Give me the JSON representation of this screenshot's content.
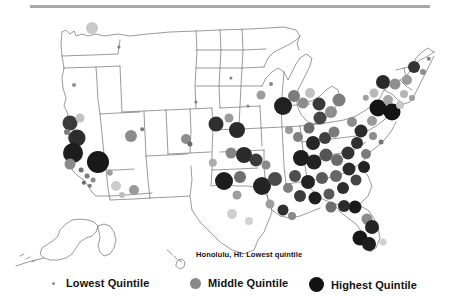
{
  "figure": {
    "type": "map",
    "region": "United States",
    "projection_insets": [
      "Alaska",
      "Hawaii"
    ],
    "annotation": {
      "text": "Honolulu, HI: Lowest quintile",
      "x": 196,
      "y": 250
    }
  },
  "legend": {
    "items": [
      {
        "label": "Lowest Quintile",
        "marker": "small-dot",
        "color": "#8c8c8c",
        "size": 3,
        "x": 48
      },
      {
        "label": "Middle Quintile",
        "marker": "medium-dot",
        "color": "#8a8a8a",
        "size": 11,
        "x": 190
      },
      {
        "label": "Highest Quintile",
        "marker": "large-dot",
        "color": "#121212",
        "size": 15,
        "x": 309
      }
    ]
  },
  "colors": {
    "lowest": "#9b9b9b",
    "lower_mid": "#c4c4c4",
    "middle": "#7e7e7e",
    "upper_mid": "#4a4a4a",
    "highest": "#141414",
    "outline": "#6f6f6f",
    "rule": "#a8a8a8"
  },
  "chart_data": {
    "type": "scatter",
    "title": "",
    "xlabel": "",
    "ylabel": "",
    "encoding": "Marker size and darkness encode quintile rank of metropolitan areas",
    "markers": [
      {
        "x": 92,
        "y": 18,
        "r": 6,
        "c": "#c9c9c9"
      },
      {
        "x": 119,
        "y": 37,
        "r": 1.6,
        "c": "#7a7a7a"
      },
      {
        "x": 74,
        "y": 75,
        "r": 2.0,
        "c": "#8e8e8e"
      },
      {
        "x": 70,
        "y": 113,
        "r": 7.5,
        "c": "#3b3b3b"
      },
      {
        "x": 80,
        "y": 108,
        "r": 4.5,
        "c": "#c2c2c2"
      },
      {
        "x": 67,
        "y": 122,
        "r": 3.0,
        "c": "#7d7d7d"
      },
      {
        "x": 77,
        "y": 128,
        "r": 8.5,
        "c": "#2d2d2d"
      },
      {
        "x": 73,
        "y": 143,
        "r": 10,
        "c": "#1d1d1d"
      },
      {
        "x": 70,
        "y": 154,
        "r": 5.5,
        "c": "#8a8a8a"
      },
      {
        "x": 81,
        "y": 160,
        "r": 2.4,
        "c": "#6f6f6f"
      },
      {
        "x": 87,
        "y": 166,
        "r": 2.4,
        "c": "#7d7d7d"
      },
      {
        "x": 93,
        "y": 170,
        "r": 2.4,
        "c": "#8a8a8a"
      },
      {
        "x": 84,
        "y": 173,
        "r": 2.2,
        "c": "#6a6a6a"
      },
      {
        "x": 90,
        "y": 176,
        "r": 2.2,
        "c": "#7a7a7a"
      },
      {
        "x": 98,
        "y": 152,
        "r": 11,
        "c": "#191919"
      },
      {
        "x": 110,
        "y": 163,
        "r": 3.2,
        "c": "#9d9d9d"
      },
      {
        "x": 116,
        "y": 176,
        "r": 5.0,
        "c": "#cccccc"
      },
      {
        "x": 122,
        "y": 185,
        "r": 3.0,
        "c": "#bdbdbd"
      },
      {
        "x": 131,
        "y": 126,
        "r": 6.0,
        "c": "#8c8c8c"
      },
      {
        "x": 142,
        "y": 119,
        "r": 1.8,
        "c": "#7a7a7a"
      },
      {
        "x": 134,
        "y": 180,
        "r": 5.0,
        "c": "#9a9a9a"
      },
      {
        "x": 186,
        "y": 129,
        "r": 5.0,
        "c": "#8d8d8d"
      },
      {
        "x": 190,
        "y": 134,
        "r": 2.6,
        "c": "#6a6a6a"
      },
      {
        "x": 213,
        "y": 153,
        "r": 4.2,
        "c": "#adadad"
      },
      {
        "x": 216,
        "y": 114,
        "r": 7.5,
        "c": "#303030"
      },
      {
        "x": 229,
        "y": 108,
        "r": 4.5,
        "c": "#9a9a9a"
      },
      {
        "x": 237,
        "y": 120,
        "r": 8.0,
        "c": "#2b2b2b"
      },
      {
        "x": 224,
        "y": 171,
        "r": 9.0,
        "c": "#1c1c1c"
      },
      {
        "x": 240,
        "y": 167,
        "r": 6.0,
        "c": "#6e6e6e"
      },
      {
        "x": 237,
        "y": 185,
        "r": 4.5,
        "c": "#9d9d9d"
      },
      {
        "x": 232,
        "y": 204,
        "r": 5.0,
        "c": "#cfcfcf"
      },
      {
        "x": 249,
        "y": 211,
        "r": 4.0,
        "c": "#d2d2d2"
      },
      {
        "x": 262,
        "y": 176,
        "r": 9.0,
        "c": "#242424"
      },
      {
        "x": 275,
        "y": 169,
        "r": 7.0,
        "c": "#4a4a4a"
      },
      {
        "x": 270,
        "y": 194,
        "r": 4.5,
        "c": "#9e9e9e"
      },
      {
        "x": 231,
        "y": 143,
        "r": 5.5,
        "c": "#858585"
      },
      {
        "x": 244,
        "y": 145,
        "r": 8.0,
        "c": "#2a2a2a"
      },
      {
        "x": 256,
        "y": 150,
        "r": 6.5,
        "c": "#3a3a3a"
      },
      {
        "x": 266,
        "y": 155,
        "r": 4.5,
        "c": "#8b8b8b"
      },
      {
        "x": 283,
        "y": 96,
        "r": 9.0,
        "c": "#212121"
      },
      {
        "x": 294,
        "y": 86,
        "r": 6.0,
        "c": "#7c7c7c"
      },
      {
        "x": 303,
        "y": 93,
        "r": 5.5,
        "c": "#8d8d8d"
      },
      {
        "x": 310,
        "y": 83,
        "r": 5.0,
        "c": "#c0c0c0"
      },
      {
        "x": 319,
        "y": 94,
        "r": 6.5,
        "c": "#3a3a3a"
      },
      {
        "x": 331,
        "y": 102,
        "r": 6.0,
        "c": "#8e8e8e"
      },
      {
        "x": 339,
        "y": 90,
        "r": 6.5,
        "c": "#7d7d7d"
      },
      {
        "x": 320,
        "y": 108,
        "r": 6.5,
        "c": "#464646"
      },
      {
        "x": 309,
        "y": 118,
        "r": 5.5,
        "c": "#6b6b6b"
      },
      {
        "x": 298,
        "y": 127,
        "r": 5.0,
        "c": "#7f7f7f"
      },
      {
        "x": 289,
        "y": 120,
        "r": 4.0,
        "c": "#9b9b9b"
      },
      {
        "x": 313,
        "y": 133,
        "r": 7.0,
        "c": "#262626"
      },
      {
        "x": 325,
        "y": 128,
        "r": 6.0,
        "c": "#3f3f3f"
      },
      {
        "x": 334,
        "y": 122,
        "r": 5.5,
        "c": "#7a7a7a"
      },
      {
        "x": 301,
        "y": 148,
        "r": 8.0,
        "c": "#1e1e1e"
      },
      {
        "x": 314,
        "y": 152,
        "r": 7.5,
        "c": "#232323"
      },
      {
        "x": 326,
        "y": 145,
        "r": 6.5,
        "c": "#555555"
      },
      {
        "x": 337,
        "y": 150,
        "r": 6.0,
        "c": "#6b6b6b"
      },
      {
        "x": 348,
        "y": 143,
        "r": 6.5,
        "c": "#333333"
      },
      {
        "x": 357,
        "y": 133,
        "r": 6.0,
        "c": "#2f2f2f"
      },
      {
        "x": 349,
        "y": 159,
        "r": 6.5,
        "c": "#2a2a2a"
      },
      {
        "x": 336,
        "y": 166,
        "r": 6.0,
        "c": "#666666"
      },
      {
        "x": 322,
        "y": 168,
        "r": 6.0,
        "c": "#5a5a5a"
      },
      {
        "x": 308,
        "y": 172,
        "r": 7.0,
        "c": "#222222"
      },
      {
        "x": 295,
        "y": 166,
        "r": 6.0,
        "c": "#4e4e4e"
      },
      {
        "x": 288,
        "y": 178,
        "r": 5.0,
        "c": "#7e7e7e"
      },
      {
        "x": 300,
        "y": 186,
        "r": 6.0,
        "c": "#3c3c3c"
      },
      {
        "x": 315,
        "y": 188,
        "r": 6.5,
        "c": "#1f1f1f"
      },
      {
        "x": 329,
        "y": 184,
        "r": 5.5,
        "c": "#575757"
      },
      {
        "x": 343,
        "y": 178,
        "r": 6.0,
        "c": "#2e2e2e"
      },
      {
        "x": 356,
        "y": 170,
        "r": 5.5,
        "c": "#444444"
      },
      {
        "x": 364,
        "y": 157,
        "r": 6.0,
        "c": "#212121"
      },
      {
        "x": 366,
        "y": 144,
        "r": 5.0,
        "c": "#7b7b7b"
      },
      {
        "x": 361,
        "y": 121,
        "r": 6.5,
        "c": "#2b2b2b"
      },
      {
        "x": 352,
        "y": 112,
        "r": 5.0,
        "c": "#8b8b8b"
      },
      {
        "x": 372,
        "y": 111,
        "r": 5.0,
        "c": "#9a9a9a"
      },
      {
        "x": 378,
        "y": 98,
        "r": 8.5,
        "c": "#141414"
      },
      {
        "x": 388,
        "y": 90,
        "r": 5.0,
        "c": "#a5a5a5"
      },
      {
        "x": 392,
        "y": 102,
        "r": 8.5,
        "c": "#151515"
      },
      {
        "x": 400,
        "y": 95,
        "r": 4.0,
        "c": "#c6c6c6"
      },
      {
        "x": 383,
        "y": 72,
        "r": 7.0,
        "c": "#2a2a2a"
      },
      {
        "x": 395,
        "y": 74,
        "r": 5.5,
        "c": "#8f8f8f"
      },
      {
        "x": 407,
        "y": 70,
        "r": 5.0,
        "c": "#9b9b9b"
      },
      {
        "x": 414,
        "y": 57,
        "r": 6.0,
        "c": "#343434"
      },
      {
        "x": 423,
        "y": 62,
        "r": 3.0,
        "c": "#8f8f8f"
      },
      {
        "x": 429,
        "y": 49,
        "r": 2.2,
        "c": "#7e7e7e"
      },
      {
        "x": 404,
        "y": 84,
        "r": 4.0,
        "c": "#b4b4b4"
      },
      {
        "x": 412,
        "y": 88,
        "r": 3.0,
        "c": "#9e9e9e"
      },
      {
        "x": 373,
        "y": 126,
        "r": 4.0,
        "c": "#8d8d8d"
      },
      {
        "x": 381,
        "y": 132,
        "r": 2.4,
        "c": "#747474"
      },
      {
        "x": 374,
        "y": 83,
        "r": 4.5,
        "c": "#b8b8b8"
      },
      {
        "x": 366,
        "y": 88,
        "r": 3.2,
        "c": "#a0a0a0"
      },
      {
        "x": 355,
        "y": 197,
        "r": 6.5,
        "c": "#1b1b1b"
      },
      {
        "x": 367,
        "y": 209,
        "r": 5.5,
        "c": "#8b8b8b"
      },
      {
        "x": 372,
        "y": 217,
        "r": 7.0,
        "c": "#262626"
      },
      {
        "x": 360,
        "y": 228,
        "r": 7.5,
        "c": "#181818"
      },
      {
        "x": 369,
        "y": 234,
        "r": 7.0,
        "c": "#1d1d1d"
      },
      {
        "x": 383,
        "y": 232,
        "r": 3.5,
        "c": "#d0d0d0"
      },
      {
        "x": 344,
        "y": 196,
        "r": 6.0,
        "c": "#2b2b2b"
      },
      {
        "x": 331,
        "y": 197,
        "r": 5.5,
        "c": "#6e6e6e"
      },
      {
        "x": 283,
        "y": 200,
        "r": 5.5,
        "c": "#2f2f2f"
      },
      {
        "x": 292,
        "y": 206,
        "r": 4.0,
        "c": "#8a8a8a"
      },
      {
        "x": 196,
        "y": 92,
        "r": 1.6,
        "c": "#757575"
      },
      {
        "x": 248,
        "y": 96,
        "r": 1.6,
        "c": "#7d7d7d"
      },
      {
        "x": 261,
        "y": 85,
        "r": 4.5,
        "c": "#9c9c9c"
      },
      {
        "x": 271,
        "y": 74,
        "r": 2.0,
        "c": "#888888"
      },
      {
        "x": 231,
        "y": 68,
        "r": 1.6,
        "c": "#808080"
      }
    ]
  }
}
